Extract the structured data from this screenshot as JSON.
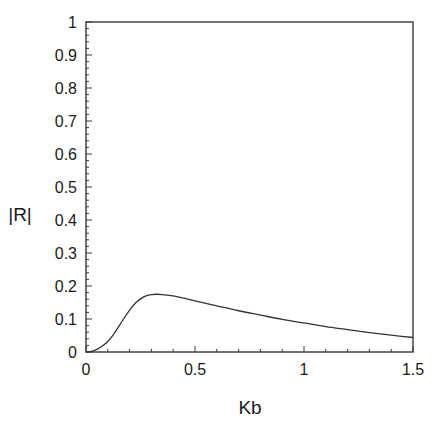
{
  "chart_data": {
    "type": "line",
    "title": "",
    "xlabel": "Kb",
    "ylabel": "|R|",
    "xlim": [
      0,
      1.5
    ],
    "ylim": [
      0,
      1
    ],
    "grid": false,
    "legend": null,
    "x_ticks": [
      0,
      0.5,
      1,
      1.5
    ],
    "x_tick_labels": [
      "0",
      "0.5",
      "1",
      "1.5"
    ],
    "x_minor_step": 0.1,
    "y_ticks": [
      0,
      0.1,
      0.2,
      0.3,
      0.4,
      0.5,
      0.6,
      0.7,
      0.8,
      0.9,
      1
    ],
    "y_tick_labels": [
      "0",
      "0.1",
      "0.2",
      "0.3",
      "0.4",
      "0.5",
      "0.6",
      "0.7",
      "0.8",
      "0.9",
      "1"
    ],
    "y_minor_step": 0.02,
    "series": [
      {
        "name": "|R|",
        "color": "#333333",
        "x": [
          0,
          0.025,
          0.05,
          0.075,
          0.1,
          0.125,
          0.15,
          0.175,
          0.2,
          0.225,
          0.25,
          0.275,
          0.3,
          0.325,
          0.35,
          0.4,
          0.45,
          0.5,
          0.6,
          0.7,
          0.8,
          0.9,
          1.0,
          1.1,
          1.2,
          1.3,
          1.4,
          1.5
        ],
        "values": [
          0,
          0.002,
          0.008,
          0.018,
          0.032,
          0.052,
          0.077,
          0.103,
          0.127,
          0.147,
          0.161,
          0.17,
          0.174,
          0.175,
          0.174,
          0.17,
          0.163,
          0.155,
          0.14,
          0.125,
          0.112,
          0.099,
          0.088,
          0.077,
          0.068,
          0.059,
          0.051,
          0.044
        ]
      }
    ]
  }
}
